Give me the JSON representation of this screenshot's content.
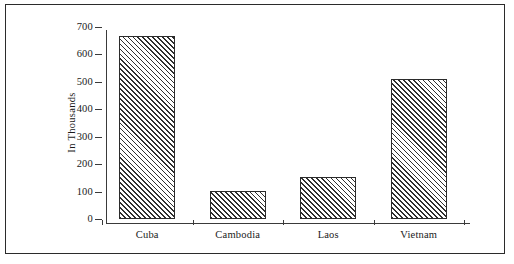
{
  "figure": {
    "background_color": "#ffffff",
    "frame_color": "#2b2b2b",
    "axis_color": "#3a3a3a",
    "bar_outline_color": "#2b2b2b",
    "bar_hatch_color": "#2f2f2f"
  },
  "chart_data": {
    "type": "bar",
    "title": "",
    "xlabel": "",
    "ylabel": "In Thousands",
    "categories": [
      "Cuba",
      "Cambodia",
      "Laos",
      "Vietnam"
    ],
    "values": [
      668,
      103,
      152,
      512
    ],
    "ylim": [
      0,
      700
    ],
    "yticks": [
      0,
      100,
      200,
      300,
      400,
      500,
      600,
      700
    ],
    "ytick_labels": [
      "0",
      "100",
      "200",
      "300",
      "400",
      "500",
      "600",
      "700"
    ],
    "grid": false,
    "legend": null,
    "bar_style": "diagonal-hatch",
    "annotations": []
  }
}
